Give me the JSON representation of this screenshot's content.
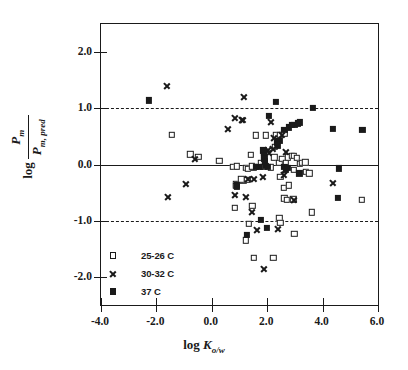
{
  "chart_data": {
    "type": "scatter",
    "title": "",
    "xlabel": "log K_o/w",
    "ylabel": "log (P_m / P_m,pred)",
    "xlim": [
      -4.0,
      6.0
    ],
    "ylim": [
      -2.5,
      2.5
    ],
    "grid": false,
    "legend_position": "lower-left-inside",
    "xticks": [
      "-4.0",
      "-2.0",
      "0.0",
      "2.0",
      "4.0",
      "6.0"
    ],
    "xtick_values": [
      -4.0,
      -2.0,
      0.0,
      2.0,
      4.0,
      6.0
    ],
    "yticks": [
      "2.0",
      "1.0",
      "0.0",
      "-1.0",
      "-2.0"
    ],
    "ytick_values": [
      2.0,
      1.0,
      0.0,
      -1.0,
      -2.0
    ],
    "reference_lines": [
      {
        "y": 1.0,
        "style": "dashed"
      },
      {
        "y": 0.0,
        "style": "solid"
      },
      {
        "y": -1.0,
        "style": "dashed"
      }
    ],
    "series": [
      {
        "name": "25-26 C",
        "marker": "open-square",
        "points": [
          [
            -1.45,
            0.53
          ],
          [
            -0.77,
            0.18
          ],
          [
            -0.49,
            0.14
          ],
          [
            0.27,
            0.07
          ],
          [
            0.78,
            -0.04
          ],
          [
            0.86,
            -0.35
          ],
          [
            0.88,
            -0.38
          ],
          [
            1.22,
            -0.06
          ],
          [
            1.3,
            -0.08
          ],
          [
            1.14,
            -0.28
          ],
          [
            1.4,
            0.17
          ],
          [
            1.52,
            -0.05
          ],
          [
            1.58,
            0.52
          ],
          [
            1.95,
            0.52
          ],
          [
            2.32,
            0.52
          ],
          [
            2.48,
            0.53
          ],
          [
            2.62,
            0.55
          ],
          [
            1.88,
            0.22
          ],
          [
            1.78,
            0.03
          ],
          [
            1.92,
            0.06
          ],
          [
            1.86,
            -0.04
          ],
          [
            2.12,
            -0.05
          ],
          [
            2.26,
            0.13
          ],
          [
            2.44,
            0.03
          ],
          [
            2.55,
            0.1
          ],
          [
            2.68,
            0.02
          ],
          [
            2.74,
            0.13
          ],
          [
            2.88,
            0.15
          ],
          [
            2.96,
            0.16
          ],
          [
            3.06,
            0.12
          ],
          [
            3.18,
            0.01
          ],
          [
            3.26,
            0.03
          ],
          [
            3.38,
            0.04
          ],
          [
            2.96,
            -0.09
          ],
          [
            3.4,
            -0.13
          ],
          [
            3.52,
            -0.16
          ],
          [
            2.47,
            -0.22
          ],
          [
            2.6,
            -0.41
          ],
          [
            2.78,
            -0.37
          ],
          [
            2.62,
            -0.6
          ],
          [
            2.7,
            -0.63
          ],
          [
            2.94,
            -0.62
          ],
          [
            5.42,
            -0.63
          ],
          [
            3.6,
            -0.85
          ],
          [
            2.44,
            -0.96
          ],
          [
            2.48,
            -1.04
          ],
          [
            2.98,
            -1.23
          ],
          [
            0.82,
            -0.77
          ],
          [
            1.46,
            -0.74
          ],
          [
            1.34,
            -1.06
          ],
          [
            1.22,
            -1.35
          ],
          [
            1.52,
            -1.66
          ],
          [
            2.22,
            -1.66
          ],
          [
            0.9,
            -0.03
          ],
          [
            1.06,
            -0.26
          ],
          [
            1.28,
            -0.27
          ],
          [
            2.28,
            0.32
          ],
          [
            1.44,
            -0.03
          ]
        ]
      },
      {
        "name": "30-32 C",
        "marker": "cross",
        "points": [
          [
            -1.63,
            1.4
          ],
          [
            1.18,
            1.2
          ],
          [
            0.82,
            0.83
          ],
          [
            1.08,
            0.8
          ],
          [
            1.14,
            0.8
          ],
          [
            0.58,
            0.64
          ],
          [
            2.12,
            0.76
          ],
          [
            2.54,
            0.52
          ],
          [
            2.22,
            0.28
          ],
          [
            2.68,
            0.22
          ],
          [
            2.04,
            0.26
          ],
          [
            2.64,
            -0.1
          ],
          [
            2.62,
            -0.18
          ],
          [
            -0.62,
            0.1
          ],
          [
            -0.93,
            -0.35
          ],
          [
            -1.57,
            -0.57
          ],
          [
            0.82,
            -0.54
          ],
          [
            1.22,
            -0.58
          ],
          [
            1.52,
            -0.25
          ],
          [
            1.86,
            -0.22
          ],
          [
            1.32,
            -0.26
          ],
          [
            1.44,
            -0.85
          ],
          [
            1.62,
            -1.16
          ],
          [
            2.4,
            -1.15
          ],
          [
            2.98,
            -0.64
          ],
          [
            4.36,
            -0.33
          ],
          [
            1.9,
            -1.86
          ],
          [
            2.26,
            0.47
          ],
          [
            2.08,
            0.2
          ]
        ]
      },
      {
        "name": "37 C",
        "marker": "filled-square",
        "points": [
          [
            -2.26,
            1.14
          ],
          [
            2.3,
            1.12
          ],
          [
            3.66,
            1.01
          ],
          [
            2.06,
            0.86
          ],
          [
            2.62,
            0.62
          ],
          [
            2.78,
            0.66
          ],
          [
            2.88,
            0.7
          ],
          [
            2.98,
            0.7
          ],
          [
            3.1,
            0.73
          ],
          [
            3.18,
            0.75
          ],
          [
            4.36,
            0.63
          ],
          [
            5.44,
            0.62
          ],
          [
            2.36,
            0.38
          ],
          [
            2.44,
            0.42
          ],
          [
            2.4,
            0.34
          ],
          [
            1.86,
            0.25
          ],
          [
            1.88,
            0.16
          ],
          [
            1.9,
            0.1
          ],
          [
            1.92,
            0.05
          ],
          [
            1.94,
            -0.02
          ],
          [
            2.62,
            -0.04
          ],
          [
            2.68,
            -0.09
          ],
          [
            2.74,
            -0.06
          ],
          [
            1.72,
            -0.05
          ],
          [
            4.6,
            -0.07
          ],
          [
            3.16,
            -0.16
          ],
          [
            0.9,
            -0.36
          ],
          [
            0.92,
            -0.4
          ],
          [
            4.56,
            -0.6
          ],
          [
            1.28,
            -1.26
          ],
          [
            1.76,
            -0.99
          ],
          [
            1.98,
            -1.13
          ],
          [
            2.04,
            -0.04
          ],
          [
            1.58,
            -0.05
          ]
        ]
      }
    ]
  },
  "axes": {
    "x_title_prefix": "log",
    "x_title_symbol": "K",
    "x_title_sub": "o/w",
    "y_title_prefix": "log",
    "y_num_symbol": "P",
    "y_num_sub": "m",
    "y_den_symbol": "P",
    "y_den_sub": "m, pred"
  },
  "legend": {
    "items": [
      {
        "label": "25-26 C",
        "marker": "open-square"
      },
      {
        "label": "30-32 C",
        "marker": "cross"
      },
      {
        "label": "37 C",
        "marker": "filled-square"
      }
    ]
  }
}
